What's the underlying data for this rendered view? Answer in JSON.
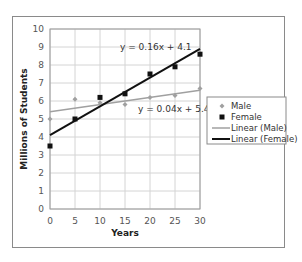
{
  "chart_data": {
    "type": "scatter",
    "title": "",
    "xlabel": "Years",
    "ylabel": "Millions of Students",
    "xlim": [
      0,
      30
    ],
    "ylim": [
      0,
      10
    ],
    "x_ticks": [
      0,
      5,
      10,
      15,
      20,
      25,
      30
    ],
    "y_ticks": [
      0,
      1,
      2,
      3,
      4,
      5,
      6,
      7,
      8,
      9,
      10
    ],
    "grid": true,
    "legend_position": "right",
    "x": [
      0,
      5,
      10,
      15,
      20,
      25,
      30
    ],
    "series": [
      {
        "name": "Male",
        "marker": "diamond",
        "color": "#a0a0a0",
        "values": [
          5.0,
          6.1,
          5.9,
          5.8,
          6.2,
          6.3,
          6.7
        ]
      },
      {
        "name": "Female",
        "marker": "square",
        "color": "#111111",
        "values": [
          3.5,
          5.0,
          6.2,
          6.4,
          7.5,
          7.9,
          8.6
        ]
      }
    ],
    "trendlines": [
      {
        "name": "Linear (Male)",
        "slope": 0.04,
        "intercept": 5.4,
        "equation": "y = 0.04x + 5.4",
        "color": "#a0a0a0"
      },
      {
        "name": "Linear (Female)",
        "slope": 0.16,
        "intercept": 4.1,
        "equation": "y = 0.16x + 4.1",
        "color": "#111111"
      }
    ],
    "legend": [
      "Male",
      "Female",
      "Linear (Male)",
      "Linear (Female)"
    ]
  }
}
